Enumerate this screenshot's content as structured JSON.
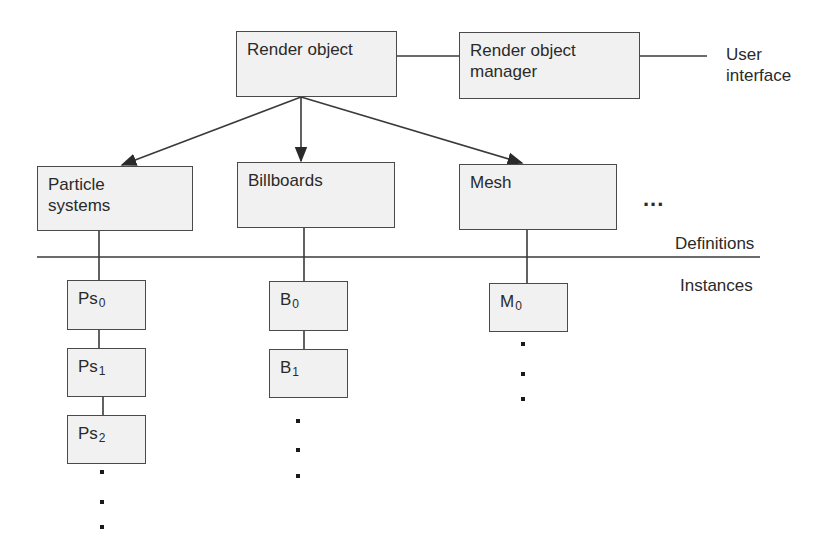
{
  "top": {
    "render_object": "Render object",
    "manager": "Render  object manager",
    "user_interface": "User interface"
  },
  "definitions": {
    "items": [
      "Particle systems",
      "Billboards",
      "Mesh"
    ],
    "ellipsis": "..."
  },
  "section_labels": {
    "definitions": "Definitions",
    "instances": "Instances"
  },
  "instances": {
    "particle": [
      {
        "base": "Ps",
        "sub": "0"
      },
      {
        "base": "Ps",
        "sub": "1"
      },
      {
        "base": "Ps",
        "sub": "2"
      }
    ],
    "billboard": [
      {
        "base": "B",
        "sub": "0"
      },
      {
        "base": "B",
        "sub": "1"
      }
    ],
    "mesh": [
      {
        "base": "M",
        "sub": "0"
      }
    ]
  },
  "colors": {
    "box_fill": "#f1f1f1",
    "stroke": "#4a4a4a"
  }
}
